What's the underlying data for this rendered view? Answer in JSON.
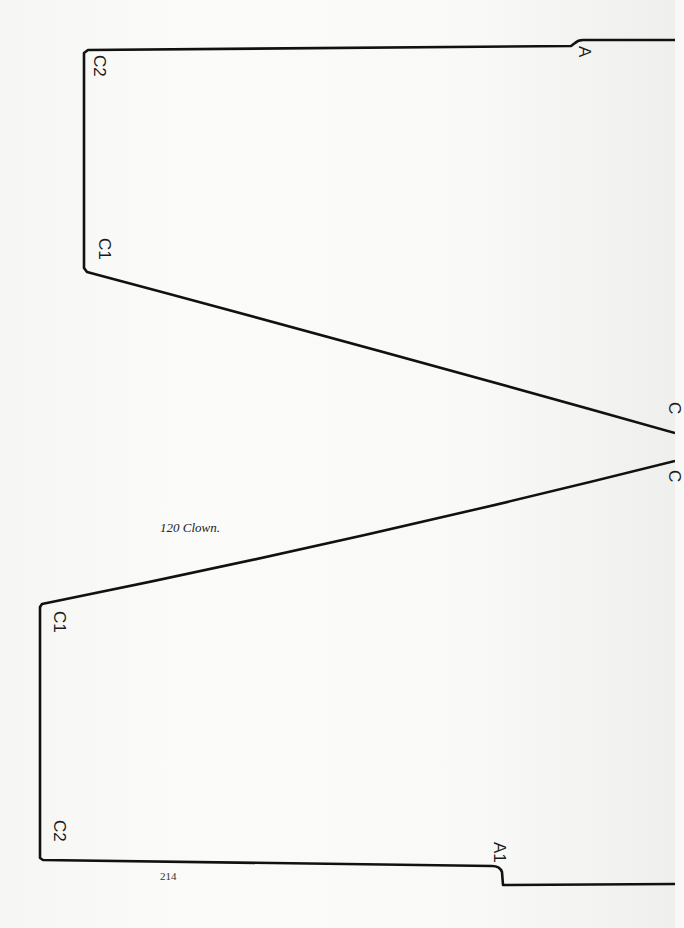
{
  "caption": "120  Clown.",
  "page_number": "214",
  "labels": {
    "upper_c2": "C2",
    "upper_c1": "C1",
    "upper_a": "A",
    "lower_c1": "C1",
    "lower_c2": "C2",
    "lower_a1": "A1",
    "right_mark_top": "C",
    "right_mark_bottom": "C"
  },
  "colors": {
    "line": "#111111",
    "paper": "#f8f8f6"
  }
}
